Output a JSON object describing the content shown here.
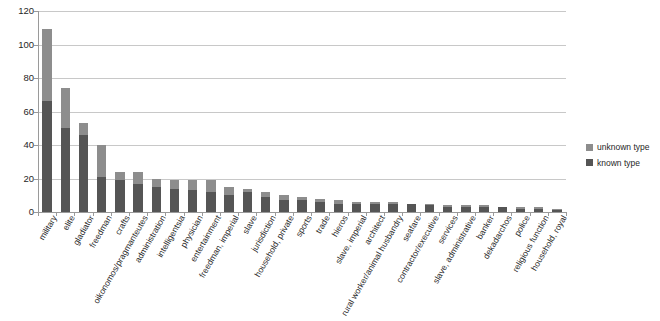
{
  "chart_data": {
    "type": "bar",
    "title": "",
    "subtitle": "",
    "xlabel": "",
    "ylabel": "",
    "ylim": [
      0,
      120
    ],
    "ytick_interval": 20,
    "yticks": [
      "0",
      "20",
      "40",
      "60",
      "80",
      "100",
      "120"
    ],
    "grid": true,
    "stacked": true,
    "legend_position": "right",
    "orientation": "vertical",
    "categories": [
      "military",
      "elite",
      "gladiator",
      "freedman",
      "crafts",
      "oikonomos/pragmanteutes",
      "administration",
      "intelligentsia",
      "physician",
      "entertainment",
      "freedman, imperial",
      "slave",
      "jurisdiction",
      "household, private",
      "sports",
      "trade",
      "hieros",
      "slave, imperial",
      "architect",
      "rural worker/animal husbandry",
      "seafare",
      "contractor/executive",
      "services",
      "slave, administrative",
      "banker",
      "dekadarchos",
      "police",
      "religious function",
      "household, royal"
    ],
    "series": [
      {
        "name": "known type",
        "color": "#555555",
        "values": [
          66,
          50,
          46,
          21,
          19,
          17,
          15,
          14,
          13,
          12,
          10,
          12,
          9,
          7,
          7,
          6,
          5,
          5,
          5,
          5,
          5,
          4,
          3,
          3,
          3,
          3,
          2,
          2,
          1
        ]
      },
      {
        "name": "unknown type",
        "color": "#8d8d8d",
        "values": [
          43,
          24,
          7,
          19,
          5,
          7,
          5,
          5,
          6,
          7,
          5,
          2,
          3,
          3,
          2,
          2,
          2,
          1,
          1,
          1,
          0,
          1,
          1,
          1,
          1,
          0,
          1,
          1,
          1
        ]
      }
    ],
    "totals": [
      109,
      74,
      53,
      40,
      24,
      24,
      20,
      19,
      19,
      19,
      15,
      14,
      12,
      10,
      9,
      8,
      7,
      6,
      6,
      6,
      5,
      5,
      4,
      4,
      4,
      3,
      3,
      3,
      2
    ]
  },
  "legend": {
    "items": [
      {
        "label": "unknown type",
        "swatch": "legend-swatch-unknown"
      },
      {
        "label": "known type",
        "swatch": "legend-swatch-known"
      }
    ]
  },
  "colors": {
    "known": "#555555",
    "unknown": "#8d8d8d",
    "gridline": "#c8c8c8",
    "axis": "#9a9a9a",
    "background": "#ffffff"
  }
}
